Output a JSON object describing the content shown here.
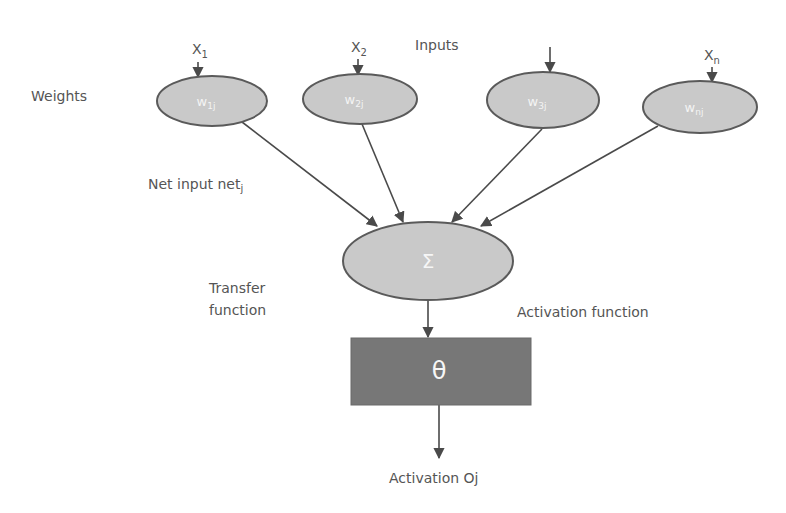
{
  "diagram": {
    "type": "artificial-neuron",
    "labels": {
      "weights": "Weights",
      "inputs": "Inputs",
      "net_input": "Net input net",
      "net_input_sub": "j",
      "transfer_line1": "Transfer",
      "transfer_line2": "function",
      "activation_function": "Activation function",
      "activation_output": "Activation Oj"
    },
    "inputs": [
      {
        "label": "X",
        "sub": "1"
      },
      {
        "label": "X",
        "sub": "2"
      },
      {
        "label": "",
        "sub": ""
      },
      {
        "label": "X",
        "sub": "n"
      }
    ],
    "weights": [
      {
        "label": "w",
        "sub": "1j"
      },
      {
        "label": "w",
        "sub": "2j"
      },
      {
        "label": "w",
        "sub": "3j"
      },
      {
        "label": "w",
        "sub": "nj"
      }
    ],
    "summation_symbol": "Σ",
    "activation_symbol": "θ",
    "colors": {
      "ellipse_fill": "#c9c9c9",
      "ellipse_stroke": "#5a5a5a",
      "box_fill": "#777777",
      "arrow": "#4a4a4a",
      "text": "#555555"
    }
  }
}
